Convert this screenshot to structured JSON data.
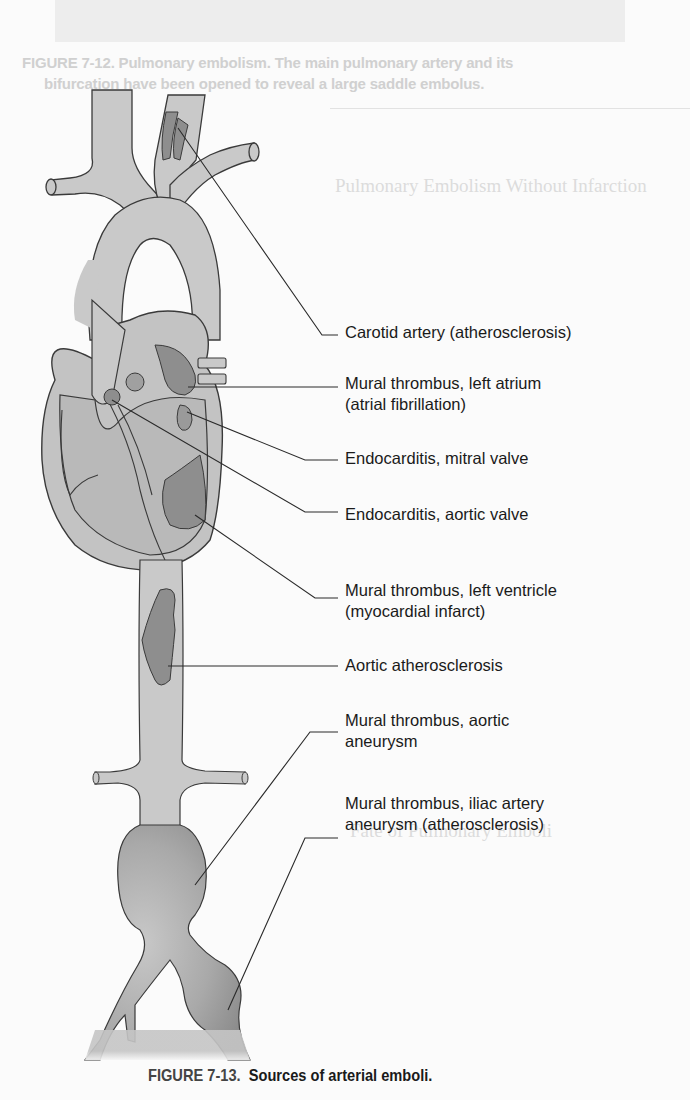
{
  "background_bleed": {
    "previous_caption_line1": "FIGURE 7-12.  Pulmonary embolism. The main pulmonary artery and its",
    "previous_caption_line2": "bifurcation have been opened to reveal a large saddle embolus.",
    "section_heading": "Pulmonary Embolism Without Infarction",
    "section_heading_2": "Fate of Pulmonary Emboli"
  },
  "figure": {
    "number": "FIGURE 7-13.",
    "title": "Sources of arterial emboli."
  },
  "labels": [
    {
      "id": "carotid",
      "text": "Carotid artery (atherosclerosis)"
    },
    {
      "id": "left-atrium",
      "text": "Mural thrombus, left atrium\n(atrial fibrillation)"
    },
    {
      "id": "mitral",
      "text": "Endocarditis, mitral valve"
    },
    {
      "id": "aortic-valve",
      "text": "Endocarditis, aortic valve"
    },
    {
      "id": "left-ventricle",
      "text": "Mural thrombus, left ventricle\n(myocardial infarct)"
    },
    {
      "id": "aortic-athero",
      "text": "Aortic atherosclerosis"
    },
    {
      "id": "aortic-aneurysm",
      "text": "Mural thrombus, aortic\naneurysm"
    },
    {
      "id": "iliac-aneurysm",
      "text": "Mural thrombus, iliac artery\naneurysm (atherosclerosis)"
    }
  ],
  "colors": {
    "vessel_fill": "#c9c9c9",
    "vessel_stroke": "#3a3a3a",
    "thrombus_fill": "#8e8e8e",
    "heart_inner": "#bdbdbd",
    "text": "#1a1a1a"
  }
}
